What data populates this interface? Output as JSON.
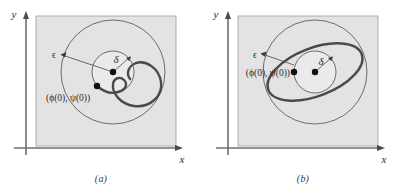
{
  "figure": {
    "background_color": "#ffffff",
    "plot_fill_color": "#e3e3e3",
    "plot_border_color": "#9a9a9a",
    "axis_color": "#6e6e6e",
    "circle_color": "#5d5d5d",
    "trajectory_color": "#4a4a4a",
    "dot_color": "#111111",
    "label_color": "#2b2b2b"
  },
  "panels": [
    {
      "id": "a",
      "caption": "(a)",
      "axes": {
        "x_label": "x",
        "y_label": "y"
      },
      "labels": {
        "epsilon": "ϵ",
        "delta": "δ",
        "initial_condition": "(ϕ(0), ψ(0))"
      },
      "geometry": {
        "center_x": 113,
        "center_y": 72,
        "outer_radius": 52,
        "inner_radius": 21
      },
      "trajectory_type": "spiral-inward",
      "point_markers": [
        {
          "name": "equilibrium-point",
          "x": 113,
          "y": 72
        },
        {
          "name": "initial-point",
          "x": 97,
          "y": 86
        }
      ]
    },
    {
      "id": "b",
      "caption": "(b)",
      "axes": {
        "x_label": "x",
        "y_label": "y"
      },
      "labels": {
        "epsilon": "ϵ",
        "delta": "δ",
        "initial_condition": "(ϕ(0), ψ(0))"
      },
      "geometry": {
        "center_x": 113,
        "center_y": 72,
        "outer_radius": 52,
        "inner_radius": 21
      },
      "trajectory_type": "closed-ellipse",
      "point_markers": [
        {
          "name": "equilibrium-point",
          "x": 113,
          "y": 72
        },
        {
          "name": "initial-point",
          "x": 92,
          "y": 72
        }
      ]
    }
  ]
}
